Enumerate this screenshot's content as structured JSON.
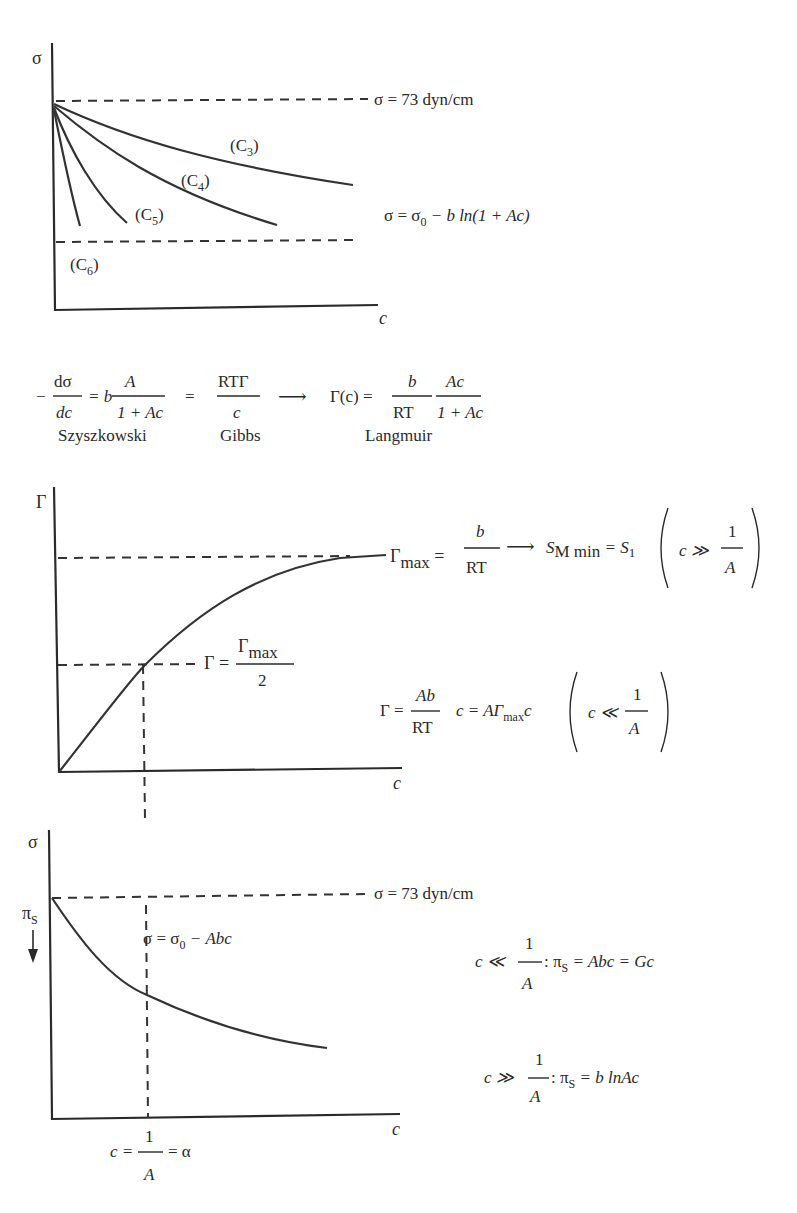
{
  "panel1": {
    "y_axis_label": "σ",
    "x_axis_label": "c",
    "reference_line": "σ = 73 dyn/cm",
    "curves": [
      "(C3)",
      "(C4)",
      "(C5)",
      "(C6)"
    ],
    "curve_labels": {
      "c3_base": "(C",
      "c3_sub": "3",
      "c4_sub": "4",
      "c5_sub": "5",
      "c6_sub": "6",
      "close": ")"
    },
    "equation": {
      "lhs": "σ = σ",
      "sub": "0",
      "rhs": " − b ln(1 + Ac)"
    }
  },
  "middle_equation": {
    "minus": "−",
    "dsigma": "dσ",
    "dc": "dc",
    "eq_b": "= b",
    "A": "A",
    "one_plus_Ac": "1 + Ac",
    "equals": "=",
    "RTGamma": "RTΓ",
    "c": "c",
    "arrow": "⟶",
    "gamma_c": "Γ(c) =",
    "b": "b",
    "RT": "RT",
    "Ac": "Ac",
    "labels": {
      "szyszkowski": "Szyszkowski",
      "gibbs": "Gibbs",
      "langmuir": "Langmuir"
    }
  },
  "panel2": {
    "y_axis_label": "Γ",
    "x_axis_label": "c",
    "gamma_max": {
      "lhs": "Γ",
      "sub": "max",
      "eq": " =",
      "num": "b",
      "den": "RT",
      "arrow": "⟶",
      "s_lhs": "S",
      "s_sub": "M min",
      "s_eq": " = S",
      "s_sub2": "1",
      "cond": "c ≫",
      "cond_num": "1",
      "cond_den": "A"
    },
    "half": {
      "lhs": "Γ =",
      "num_main": "Γ",
      "num_sub": "max",
      "den": "2"
    },
    "linear": {
      "lhs": "Γ =",
      "num": "Ab",
      "den": "RT",
      "rhs": "c = AΓ",
      "rhs_sub": "max",
      "rhs_end": "c",
      "cond": "c ≪",
      "cond_num": "1",
      "cond_den": "A"
    }
  },
  "panel3": {
    "y_axis_label": "σ",
    "x_axis_label": "c",
    "pressure_label": "π",
    "pressure_sub": "S",
    "reference_line": "σ = 73 dyn/cm",
    "curve_eq": {
      "lhs": "σ = σ",
      "sub": "0",
      "rhs": " − Abc"
    },
    "x_marker": {
      "lhs": "c =",
      "num": "1",
      "den": "A",
      "rhs": "= α"
    },
    "low_c": {
      "cond": "c ≪",
      "num": "1",
      "den": "A",
      "colon": ": π",
      "sub": "S",
      "rhs": " = Abc = Gc"
    },
    "high_c": {
      "cond": "c ≫",
      "num": "1",
      "den": "A",
      "colon": ": π",
      "sub": "S",
      "rhs": " = b lnAc"
    }
  },
  "colors": {
    "ink": "#2a2a2a",
    "background": "#ffffff"
  }
}
